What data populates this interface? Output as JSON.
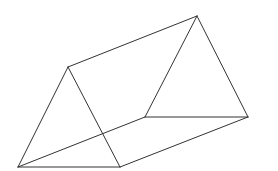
{
  "diagram": {
    "stroke_color": "#333333",
    "background": "#ffffff",
    "vertices": {
      "front_top": [
        68,
        67
      ],
      "front_bottom_left": [
        18,
        167
      ],
      "front_bottom_right": [
        120,
        167
      ],
      "back_top": [
        197,
        16
      ],
      "back_bottom_left": [
        145,
        117
      ],
      "back_bottom_right": [
        248,
        117
      ]
    },
    "edges": [
      [
        "front_top",
        "front_bottom_left"
      ],
      [
        "front_top",
        "front_bottom_right"
      ],
      [
        "front_bottom_left",
        "front_bottom_right"
      ],
      [
        "back_top",
        "back_bottom_left"
      ],
      [
        "back_top",
        "back_bottom_right"
      ],
      [
        "back_bottom_left",
        "back_bottom_right"
      ],
      [
        "front_top",
        "back_top"
      ],
      [
        "front_bottom_left",
        "back_bottom_left"
      ],
      [
        "front_bottom_right",
        "back_bottom_right"
      ]
    ]
  }
}
